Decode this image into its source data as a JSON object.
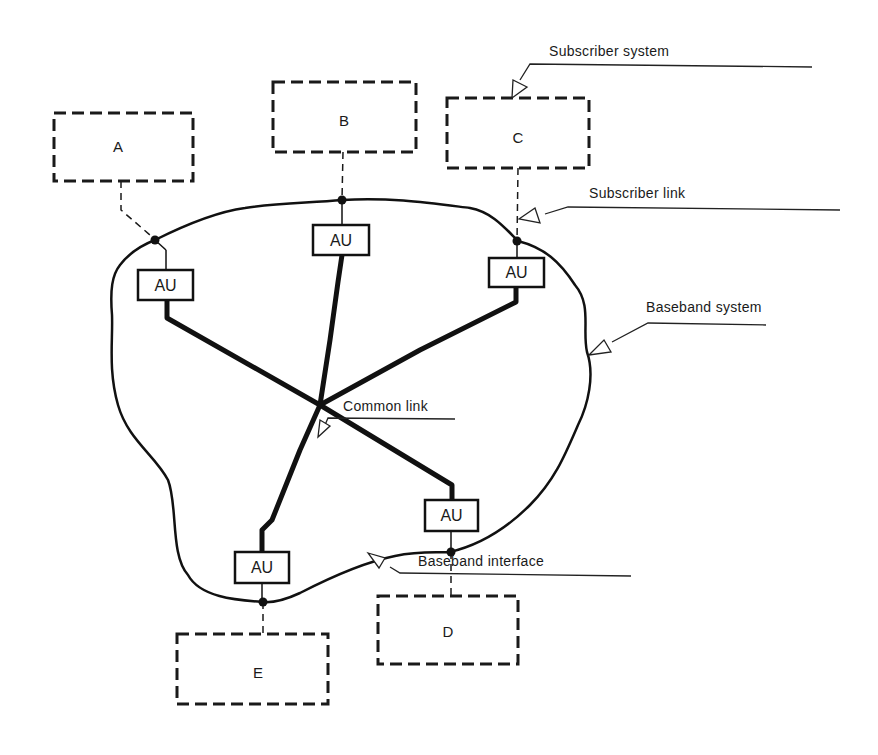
{
  "diagram": {
    "subscriber_systems": [
      {
        "id": "A",
        "label": "A"
      },
      {
        "id": "B",
        "label": "B"
      },
      {
        "id": "C",
        "label": "C"
      },
      {
        "id": "D",
        "label": "D"
      },
      {
        "id": "E",
        "label": "E"
      }
    ],
    "access_units": [
      {
        "id": "au-a",
        "label": "AU"
      },
      {
        "id": "au-b",
        "label": "AU"
      },
      {
        "id": "au-c",
        "label": "AU"
      },
      {
        "id": "au-d",
        "label": "AU"
      },
      {
        "id": "au-e",
        "label": "AU"
      }
    ],
    "annotations": {
      "subscriber_system": "Subscriber system",
      "subscriber_link": "Subscriber link",
      "baseband_system": "Baseband system",
      "common_link": "Common link",
      "baseband_interface": "Baseband interface"
    },
    "colors": {
      "ink": "#111111",
      "background": "#ffffff"
    }
  }
}
